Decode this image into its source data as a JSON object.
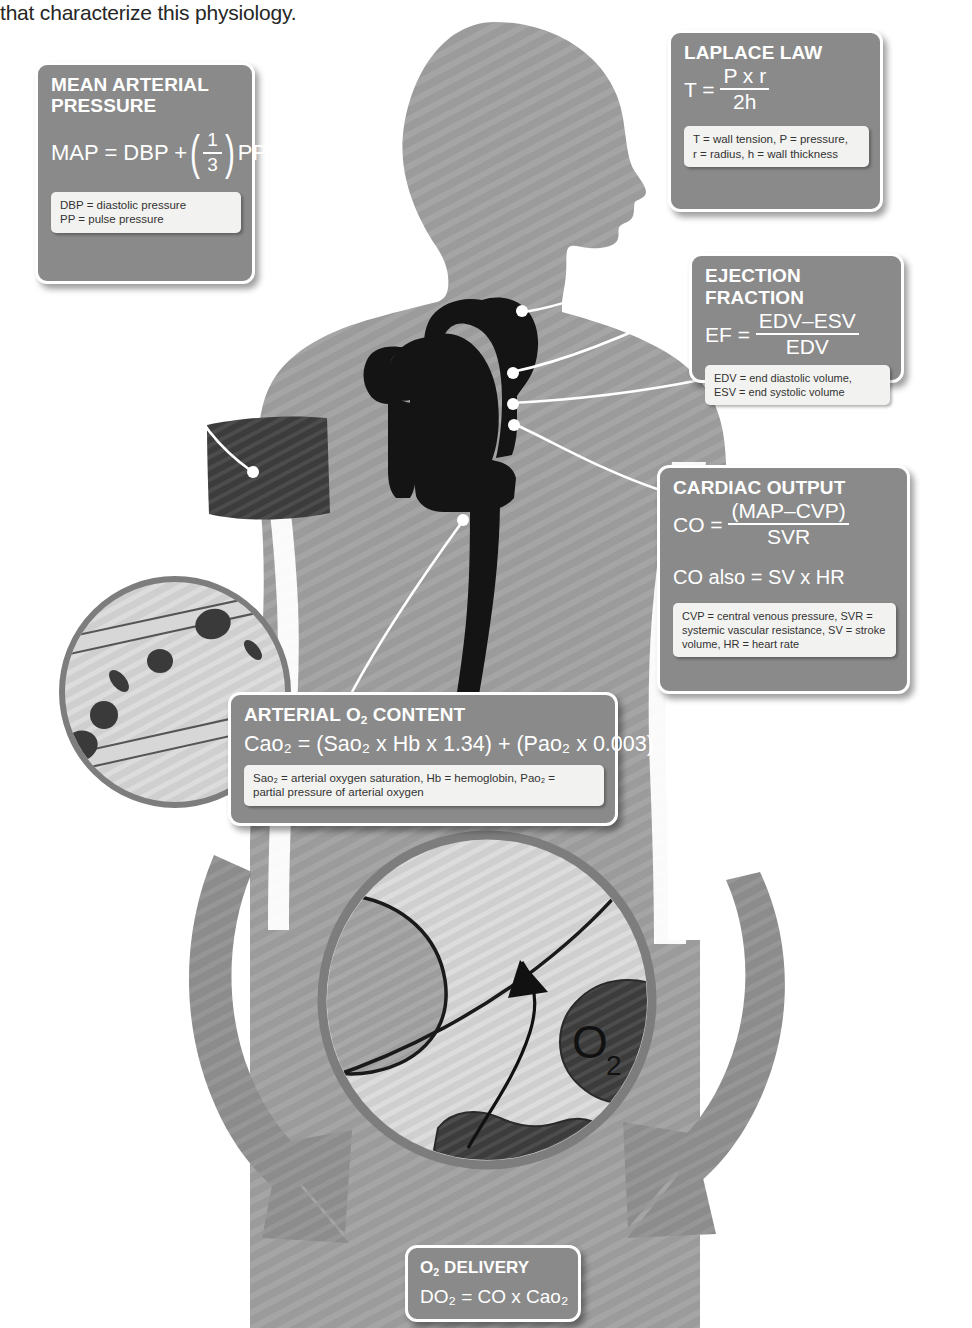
{
  "caption": {
    "text": "that characterize this physiology."
  },
  "colors": {
    "box_fill": "#8a8a8a",
    "box_border": "#ffffff",
    "legend_fill": "#f2f2f0",
    "body_silhouette": "#9b9b9b",
    "heart_dark": "#1a1a1a",
    "cuff_dark": "#3d3d3d",
    "arrow_gray": "#8c8c8c",
    "circle_ring": "#7d7d7d",
    "text_dark": "#262626"
  },
  "boxes": {
    "map": {
      "title": "MEAN ARTERIAL\nPRESSURE",
      "formula_lhs": "MAP = DBP +",
      "formula_num": "1",
      "formula_den": "3",
      "formula_rhs": "PP",
      "legend_lines": [
        "DBP = diastolic pressure",
        "PP = pulse pressure"
      ]
    },
    "laplace": {
      "title": "LAPLACE LAW",
      "formula_lhs": "T =",
      "formula_num": "P x r",
      "formula_den": "2h",
      "legend_lines": [
        "T = wall tension,  P = pressure,",
        "r = radius,  h = wall thickness"
      ]
    },
    "ejection_fraction": {
      "title": "EJECTION FRACTION",
      "formula_lhs": "EF =",
      "formula_num": "EDV–ESV",
      "formula_den": "EDV",
      "legend_lines": [
        "EDV = end diastolic volume,",
        "ESV = end systolic volume"
      ]
    },
    "cardiac_output": {
      "title": "CARDIAC OUTPUT",
      "formula_lhs": "CO =",
      "formula_num": "(MAP–CVP)",
      "formula_den": "SVR",
      "formula_alt": "CO also = SV x HR",
      "legend_lines": [
        "CVP = central venous pressure,  SVR =",
        "systemic vascular resistance,  SV = stroke",
        "volume, HR = heart rate"
      ]
    },
    "arterial_o2": {
      "title_pre": "ARTERIAL O",
      "title_sub": "2",
      "title_post": " CONTENT",
      "formula": "Cao₂ = (Sao₂ x Hb x 1.34) + (Pao₂ x 0.003)",
      "legend_lines": [
        "Sao₂ = arterial oxygen saturation,  Hb = hemoglobin, Pao₂ =",
        "partial pressure of arterial oxygen"
      ]
    },
    "o2_delivery": {
      "title_pre": "O",
      "title_sub": "2",
      "title_post": " DELIVERY",
      "formula": "DO₂ = CO x Cao₂"
    }
  },
  "figure_labels": {
    "oxygen_diffusion": "O₂",
    "oxygen_diffusion_sub": "2"
  },
  "illustration": {
    "body_silhouette": "male-torso-profile-silhouette",
    "heart": "heart-with-aorta-silhouette",
    "bp_cuff": "blood-pressure-cuff",
    "vessel_inset": "blood-vessel-with-red-cells-inset",
    "alveolus_inset": "alveolus-gas-exchange-inset",
    "arrow_left": "curved-arrow-down-left",
    "arrow_right": "curved-arrow-down-right"
  }
}
